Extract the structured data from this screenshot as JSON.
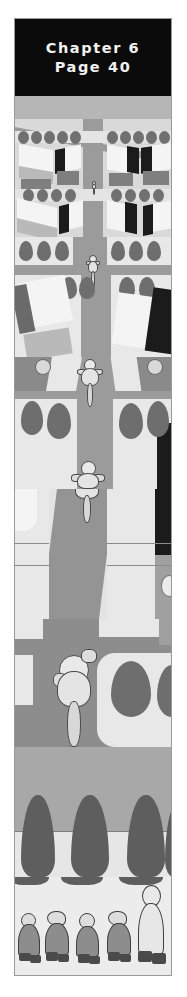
{
  "page": {
    "background_color": "#ffffff",
    "plate_border_color": "#9a9a9a"
  },
  "banner": {
    "background_color": "#0b0b0b",
    "text_color": "#f2f2f2",
    "chapter_label": "Chapter 6",
    "page_label": "Page 40"
  },
  "illustration": {
    "title": "aerial-view-cyclist-street-sequence",
    "description": "Vertical bird's-eye sequence zooming in on a cyclist riding down a suburban street",
    "palette": {
      "road": "#8e8e8e",
      "road_light": "#9a9a9a",
      "lot_light": "#e8e8e8",
      "lot_mid": "#d2d2d2",
      "roof_light": "#f4f4f4",
      "roof_dark": "#b9b9b9",
      "wall": "#7f7f7f",
      "shadow": "#1b1b1b",
      "tree": "#6e6e6e",
      "cone_tree": "#5e5e5e",
      "sky_grey": "#a8a8a8"
    },
    "scenes": [
      {
        "name": "scene-aerial-wide",
        "label": "wide aerial of town blocks and roundabout"
      },
      {
        "name": "scene-rooftops",
        "label": "rows of houses with trees along the street"
      },
      {
        "name": "scene-cyclist-distant",
        "label": "tiny cyclist on the road seen from high above"
      },
      {
        "name": "scene-cyclist-mid",
        "label": "cyclist at mid distance between hedges"
      },
      {
        "name": "scene-cyclist-near",
        "label": "cyclist closer with long road shadow"
      },
      {
        "name": "scene-cyclist-close",
        "label": "close bird's-eye view of the cyclist"
      },
      {
        "name": "scene-cone-trees",
        "label": "row of conical trees over the pavement"
      },
      {
        "name": "scene-pedestrians",
        "label": "four small figures and one adult walking"
      }
    ],
    "figures": {
      "riders": [
        {
          "name": "rider-1",
          "size": "tiny"
        },
        {
          "name": "rider-2",
          "size": "small"
        },
        {
          "name": "rider-3",
          "size": "medium"
        },
        {
          "name": "rider-4",
          "size": "large"
        },
        {
          "name": "rider-5",
          "size": "xlarge"
        }
      ],
      "pedestrians": [
        {
          "name": "pedestrian-child-1",
          "kind": "child"
        },
        {
          "name": "pedestrian-child-2",
          "kind": "child"
        },
        {
          "name": "pedestrian-child-3",
          "kind": "child"
        },
        {
          "name": "pedestrian-child-4",
          "kind": "child"
        },
        {
          "name": "pedestrian-adult-1",
          "kind": "adult"
        }
      ],
      "cone_trees_count": 4,
      "round_trees_count": 14
    }
  }
}
